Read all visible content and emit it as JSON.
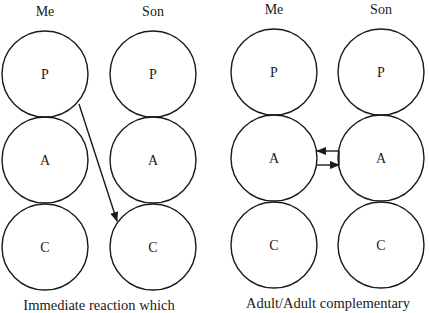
{
  "diagrams": [
    {
      "id": "left",
      "columns": [
        {
          "header": "Me",
          "states": [
            "P",
            "A",
            "C"
          ]
        },
        {
          "header": "Son",
          "states": [
            "P",
            "A",
            "C"
          ]
        }
      ],
      "caption": "Immediate reaction which",
      "transactions": [
        {
          "from": "Me.P",
          "to": "Son.C",
          "style": "diagonal-arrow"
        }
      ]
    },
    {
      "id": "right",
      "columns": [
        {
          "header": "Me",
          "states": [
            "P",
            "A",
            "C"
          ]
        },
        {
          "header": "Son",
          "states": [
            "P",
            "A",
            "C"
          ]
        }
      ],
      "caption": "Adult/Adult complementary",
      "transactions": [
        {
          "from": "Son.A",
          "to": "Me.A",
          "style": "horizontal-arrow"
        },
        {
          "from": "Me.A",
          "to": "Son.A",
          "style": "horizontal-arrow"
        }
      ]
    }
  ],
  "colors": {
    "stroke": "#1a1a1a",
    "background": "#ffffff"
  }
}
